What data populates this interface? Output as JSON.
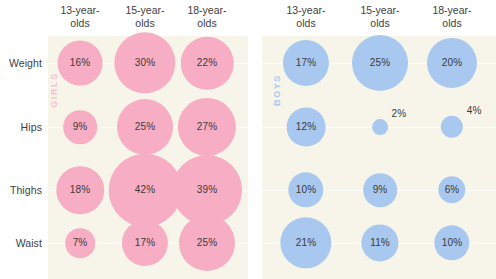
{
  "chart_data": {
    "type": "bubble-matrix",
    "title": "",
    "xlabel": "",
    "ylabel": "",
    "grid": true,
    "legend_position": "none",
    "value_unit": "%",
    "categories": [
      "13-year-olds",
      "15-year-olds",
      "18-year-olds"
    ],
    "rows": [
      "Weight",
      "Hips",
      "Thighs",
      "Waist"
    ],
    "panels": [
      {
        "name": "GIRLS",
        "color": "#f7adc4",
        "label_color": "#f7c3d2",
        "series": [
          {
            "name": "Weight",
            "values": [
              16,
              30,
              22
            ]
          },
          {
            "name": "Hips",
            "values": [
              9,
              25,
              27
            ]
          },
          {
            "name": "Thighs",
            "values": [
              18,
              42,
              39
            ]
          },
          {
            "name": "Waist",
            "values": [
              7,
              17,
              25
            ]
          }
        ]
      },
      {
        "name": "BOYS",
        "color": "#a8c8ef",
        "label_color": "#aecbee",
        "series": [
          {
            "name": "Weight",
            "values": [
              17,
              25,
              20
            ]
          },
          {
            "name": "Hips",
            "values": [
              12,
              2,
              4
            ]
          },
          {
            "name": "Thighs",
            "values": [
              10,
              9,
              6
            ]
          },
          {
            "name": "Waist",
            "values": [
              21,
              11,
              10
            ]
          }
        ]
      }
    ]
  },
  "headers": {
    "col_0": "13-year-\nolds",
    "col_1": "15-year-\nolds",
    "col_2": "18-year-\nolds"
  },
  "row_labels": {
    "r0": "Weight",
    "r1": "Hips",
    "r2": "Thighs",
    "r3": "Waist"
  },
  "series_labels": {
    "girls": "GIRLS",
    "boys": "BOYS"
  },
  "values": {
    "girls": {
      "weight": [
        "16%",
        "30%",
        "22%"
      ],
      "hips": [
        "9%",
        "25%",
        "27%"
      ],
      "thighs": [
        "18%",
        "42%",
        "39%"
      ],
      "waist": [
        "7%",
        "17%",
        "25%"
      ]
    },
    "boys": {
      "weight": [
        "17%",
        "25%",
        "20%"
      ],
      "hips": [
        "12%",
        "2%",
        "4%"
      ],
      "thighs": [
        "10%",
        "9%",
        "6%"
      ],
      "waist": [
        "21%",
        "11%",
        "10%"
      ]
    }
  },
  "colors": {
    "girls_bubble": "#f7adc4",
    "boys_bubble": "#a8c8ef",
    "plot_background": "#f7f5e9",
    "page_background": "#ffffff",
    "text": "#3e3e3e",
    "gridline": "#ffffff"
  },
  "layout": {
    "girls_panel_x": 48,
    "girls_panel_w": 200,
    "boys_panel_x": 262,
    "boys_panel_w": 234,
    "plot_top": 36,
    "row_centers": [
      63,
      127,
      190,
      243
    ],
    "girls_col_centers": [
      80,
      145,
      207
    ],
    "boys_col_centers": [
      306,
      380,
      452
    ]
  }
}
